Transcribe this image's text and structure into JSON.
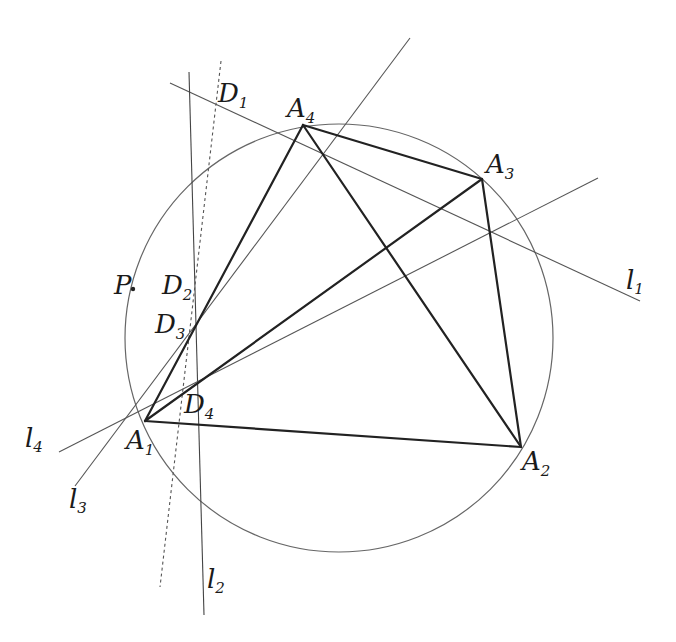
{
  "diagram": {
    "type": "geometry",
    "colors": {
      "thick": "#222222",
      "thin": "#555555",
      "circle": "#666666"
    },
    "circle": {
      "cx": 339,
      "cy": 338,
      "r": 214
    },
    "vertices": {
      "A1": {
        "x": 145,
        "y": 421,
        "label": "A",
        "sub": "1"
      },
      "A2": {
        "x": 521,
        "y": 447,
        "label": "A",
        "sub": "2"
      },
      "A3": {
        "x": 482,
        "y": 179,
        "label": "A",
        "sub": "3"
      },
      "A4": {
        "x": 303,
        "y": 125,
        "label": "A",
        "sub": "4"
      }
    },
    "lines": {
      "l1": {
        "label": "l",
        "sub": "1",
        "x1": 170,
        "y1": 83,
        "x2": 640,
        "y2": 301
      },
      "l2": {
        "label": "l",
        "sub": "2",
        "x1": 189,
        "y1": 72,
        "x2": 204,
        "y2": 615
      },
      "l3": {
        "label": "l",
        "sub": "3",
        "x1": 410,
        "y1": 38,
        "x2": 75,
        "y2": 486
      },
      "l4": {
        "label": "l",
        "sub": "4",
        "x1": 59,
        "y1": 452,
        "x2": 598,
        "y2": 178
      },
      "dotted": {
        "x1": 221,
        "y1": 61,
        "x2": 160,
        "y2": 587
      }
    },
    "points": {
      "P": {
        "label": "P",
        "x": 133,
        "y": 289
      },
      "D1": {
        "label": "D",
        "sub": "1"
      },
      "D2": {
        "label": "D",
        "sub": "2"
      },
      "D3": {
        "label": "D",
        "sub": "3"
      },
      "D4": {
        "label": "D",
        "sub": "4"
      }
    }
  }
}
